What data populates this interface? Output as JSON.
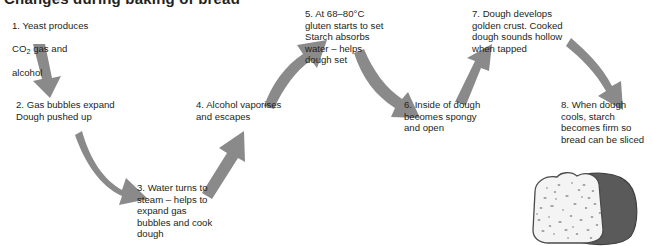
{
  "heading": {
    "text": "Changes during baking of bread",
    "note": "cropped-top-heading"
  },
  "diagram": {
    "type": "flow",
    "arrow_color": "#8a8a8a",
    "background": "#ffffff",
    "text_color": "#231f20",
    "steps": [
      {
        "number": "1.",
        "label": "step-1-yeast-produces-gas",
        "line1": "1. Yeast produces",
        "line2_pre": "CO",
        "line2_sub": "2",
        "line2_post": " gas and",
        "line3": "alcohol",
        "text": "1. Yeast produces CO2 gas and alcohol"
      },
      {
        "number": "2.",
        "label": "step-2-gas-bubbles-expand",
        "text": "2. Gas bubbles expand\nDough pushed up"
      },
      {
        "number": "3.",
        "label": "step-3-water-turns-to-steam",
        "text": "3. Water turns to\nsteam – helps to\nexpand gas\nbubbles and cook\ndough"
      },
      {
        "number": "4.",
        "label": "step-4-alcohol-vaporises",
        "text": "4. Alcohol vaporises\nand escapes"
      },
      {
        "number": "5.",
        "label": "step-5-gluten-sets",
        "text": "5. At 68–80°C\ngluten starts to set\nStarch absorbs\nwater – helps\ndough set"
      },
      {
        "number": "6.",
        "label": "step-6-inside-spongy",
        "text": "6. Inside of dough\nbecomes spongy\nand open"
      },
      {
        "number": "7.",
        "label": "step-7-golden-crust",
        "text": "7. Dough develops\ngolden crust. Cooked\ndough sounds hollow\nwhen tapped"
      },
      {
        "number": "8.",
        "label": "step-8-bread-sliced",
        "text": "8. When dough\ncools, starch\nbecomes firm so\nbread can be sliced"
      }
    ],
    "arrows": [
      {
        "name": "arrow-step1-to-step2",
        "direction": "down",
        "style": "straight"
      },
      {
        "name": "arrow-step2-to-step3",
        "direction": "down-right",
        "style": "curved"
      },
      {
        "name": "arrow-step3-to-step4",
        "direction": "up-right",
        "style": "straight"
      },
      {
        "name": "arrow-step4-to-step5",
        "direction": "up-right",
        "style": "curved"
      },
      {
        "name": "arrow-step5-to-step6",
        "direction": "down-right",
        "style": "curved"
      },
      {
        "name": "arrow-step6-to-step7",
        "direction": "up-right",
        "style": "straight"
      },
      {
        "name": "arrow-step7-to-step8",
        "direction": "down-right",
        "style": "curved"
      }
    ],
    "illustration": {
      "name": "sliced-bread-loaf",
      "alt": "Loaf of bread with cut slice face",
      "crust_color": "#5b5b5b",
      "crumb_color": "#f2f2f2",
      "speckle_color": "#9a9a9a"
    }
  }
}
